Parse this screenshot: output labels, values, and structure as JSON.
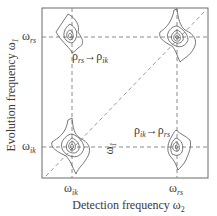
{
  "diagram": {
    "x_axis_label": "Detection frequency ω",
    "x_axis_sub": "2",
    "y_axis_label": "Evolution frequency ω",
    "y_axis_sub": "1",
    "ticks": {
      "y_top": {
        "main": "ω",
        "sub": "rs"
      },
      "y_bottom": {
        "main": "ω",
        "sub": "ik"
      },
      "x_left": {
        "main": "ω",
        "sub": "ik"
      },
      "x_right": {
        "main": "ω",
        "sub": "rs"
      }
    },
    "annotations": {
      "upper_cross_peak": {
        "from_main": "ρ",
        "from_sub": "rs",
        "arrow": "→",
        "to_main": "ρ",
        "to_sub": "ik"
      },
      "lower_cross_peak": {
        "from_main": "ρ",
        "from_sub": "ik",
        "arrow": "→",
        "to_main": "ρ",
        "to_sub": "rs"
      },
      "center_label": {
        "main": "ω",
        "sub": "1"
      }
    },
    "peaks": [
      {
        "name": "diagonal-peak-ik",
        "x": "ω_ik",
        "y": "ω_ik"
      },
      {
        "name": "diagonal-peak-rs",
        "x": "ω_rs",
        "y": "ω_rs"
      },
      {
        "name": "cross-peak-upper-left",
        "x": "ω_ik",
        "y": "ω_rs"
      },
      {
        "name": "cross-peak-lower-right",
        "x": "ω_rs",
        "y": "ω_ik"
      }
    ],
    "colors": {
      "line": "#555555",
      "dash": "#8a8a8a"
    }
  }
}
